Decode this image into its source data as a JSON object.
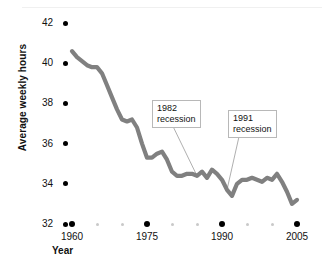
{
  "chart_data": {
    "type": "line",
    "title": "",
    "subtitle": "",
    "xlabel": "Year",
    "ylabel": "Average weekly hours",
    "xlim": [
      1958,
      2006
    ],
    "ylim": [
      32,
      42
    ],
    "grid": false,
    "legend": null,
    "line_color": "#808080",
    "marker_color": "#000000",
    "minor_marker_color": "#c9c9c9",
    "x_ticks": [
      "1960",
      "1975",
      "1990",
      "2005"
    ],
    "x_tick_values": [
      1960,
      1975,
      1990,
      2005
    ],
    "x_minor_values": [
      1965,
      1970,
      1980,
      1985,
      1995,
      2000
    ],
    "y_ticks": [
      "32",
      "34",
      "36",
      "38",
      "40",
      "42"
    ],
    "y_tick_values": [
      32,
      34,
      36,
      38,
      40,
      42
    ],
    "series": [
      {
        "name": "Average weekly hours",
        "x": [
          1960,
          1961,
          1962,
          1963,
          1964,
          1965,
          1966,
          1967,
          1968,
          1969,
          1970,
          1971,
          1972,
          1973,
          1974,
          1975,
          1976,
          1977,
          1978,
          1979,
          1980,
          1981,
          1982,
          1983,
          1984,
          1985,
          1986,
          1987,
          1988,
          1989,
          1990,
          1991,
          1992,
          1993,
          1994,
          1995,
          1996,
          1997,
          1998,
          1999,
          2000,
          2001,
          2002,
          2003,
          2004,
          2005
        ],
        "values": [
          40.6,
          40.3,
          40.1,
          39.9,
          39.8,
          39.8,
          39.5,
          38.9,
          38.3,
          37.7,
          37.2,
          37.1,
          37.2,
          36.8,
          36.0,
          35.3,
          35.3,
          35.5,
          35.6,
          35.2,
          34.6,
          34.4,
          34.4,
          34.5,
          34.5,
          34.4,
          34.6,
          34.3,
          34.7,
          34.5,
          34.2,
          33.7,
          33.4,
          34.0,
          34.2,
          34.2,
          34.3,
          34.2,
          34.1,
          34.3,
          34.2,
          34.5,
          34.1,
          33.6,
          33.0,
          33.2
        ]
      }
    ],
    "annotations": [
      {
        "id": "recession-1982",
        "line1": "1982",
        "line2": "recession",
        "target_year": 1985,
        "target_value": 34.4
      },
      {
        "id": "recession-1991",
        "line1": "1991",
        "line2": "recession",
        "target_year": 1991,
        "target_value": 33.7
      }
    ]
  }
}
